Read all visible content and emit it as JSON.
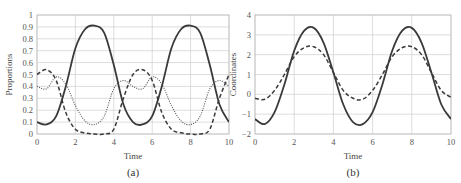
{
  "chart_data": [
    {
      "type": "line",
      "caption": "(a)",
      "title": "",
      "xlabel": "Time",
      "ylabel": "Proportions",
      "xlim": [
        0,
        10
      ],
      "ylim": [
        0,
        1
      ],
      "xticks": [
        "0",
        "2",
        "4",
        "6",
        "8",
        "10"
      ],
      "yticks": [
        "0",
        "0.1",
        "0.2",
        "0.3",
        "0.4",
        "0.5",
        "0.6",
        "0.7",
        "0.8",
        "0.9",
        "1"
      ],
      "grid": true,
      "legend": null,
      "series": [
        {
          "name": "solid",
          "style": "solid",
          "x": [
            0,
            0.5,
            1,
            1.5,
            2,
            2.5,
            3,
            3.5,
            4,
            4.5,
            5,
            5.5,
            6,
            6.5,
            7,
            7.5,
            8,
            8.5,
            9,
            9.5,
            10
          ],
          "values": [
            0.1,
            0.08,
            0.15,
            0.4,
            0.72,
            0.88,
            0.91,
            0.85,
            0.58,
            0.25,
            0.1,
            0.08,
            0.15,
            0.4,
            0.72,
            0.88,
            0.91,
            0.85,
            0.58,
            0.25,
            0.1
          ]
        },
        {
          "name": "dashed",
          "style": "dashed",
          "x": [
            0,
            0.5,
            1,
            1.5,
            2,
            2.5,
            3,
            3.5,
            4,
            4.5,
            5,
            5.5,
            6,
            6.5,
            7,
            7.5,
            8,
            8.5,
            9,
            9.5,
            10
          ],
          "values": [
            0.5,
            0.54,
            0.45,
            0.18,
            0.04,
            0.01,
            0.0,
            0.0,
            0.04,
            0.3,
            0.5,
            0.54,
            0.45,
            0.18,
            0.04,
            0.01,
            0.0,
            0.0,
            0.04,
            0.3,
            0.5
          ]
        },
        {
          "name": "dotted",
          "style": "dotted",
          "x": [
            0,
            0.5,
            1,
            1.5,
            2,
            2.5,
            3,
            3.5,
            4,
            4.5,
            5,
            5.5,
            6,
            6.5,
            7,
            7.5,
            8,
            8.5,
            9,
            9.5,
            10
          ],
          "values": [
            0.4,
            0.38,
            0.48,
            0.42,
            0.24,
            0.11,
            0.08,
            0.15,
            0.38,
            0.45,
            0.4,
            0.38,
            0.48,
            0.42,
            0.24,
            0.11,
            0.08,
            0.15,
            0.38,
            0.45,
            0.4
          ]
        }
      ]
    },
    {
      "type": "line",
      "caption": "(b)",
      "title": "",
      "xlabel": "Time",
      "ylabel": "Coordinates",
      "xlim": [
        0,
        10
      ],
      "ylim": [
        -2,
        4
      ],
      "xticks": [
        "0",
        "2",
        "4",
        "6",
        "8",
        "10"
      ],
      "yticks": [
        "-2",
        "-1",
        "0",
        "1",
        "2",
        "3",
        "4"
      ],
      "grid": true,
      "legend": null,
      "series": [
        {
          "name": "solid",
          "style": "solid",
          "x": [
            0,
            0.5,
            1,
            1.5,
            2,
            2.5,
            3,
            3.5,
            4,
            4.5,
            5,
            5.5,
            6,
            6.5,
            7,
            7.5,
            8,
            8.5,
            9,
            9.5,
            10
          ],
          "values": [
            -1.25,
            -1.5,
            -0.9,
            0.5,
            2.2,
            3.2,
            3.35,
            2.6,
            1.1,
            -0.5,
            -1.4,
            -1.5,
            -0.9,
            0.5,
            2.2,
            3.2,
            3.35,
            2.6,
            1.1,
            -0.5,
            -1.25
          ]
        },
        {
          "name": "dashed",
          "style": "dashed",
          "x": [
            0,
            0.5,
            1,
            1.5,
            2,
            2.5,
            3,
            3.5,
            4,
            4.5,
            5,
            5.5,
            6,
            6.5,
            7,
            7.5,
            8,
            8.5,
            9,
            9.5,
            10
          ],
          "values": [
            -0.2,
            -0.25,
            0.2,
            1.0,
            1.9,
            2.35,
            2.4,
            2.0,
            1.1,
            0.2,
            -0.2,
            -0.25,
            0.2,
            1.0,
            1.9,
            2.35,
            2.4,
            2.0,
            1.1,
            0.2,
            -0.15
          ]
        }
      ]
    }
  ]
}
